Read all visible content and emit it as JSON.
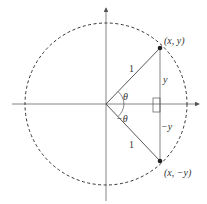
{
  "diagram": {
    "labels": {
      "point_top": "(x, y)",
      "point_bottom": "(x, −y)",
      "radius_top": "1",
      "radius_bottom": "1",
      "angle_pos": "θ",
      "angle_neg": "−θ",
      "side_pos": "y",
      "side_neg": "−y"
    },
    "colors": {
      "axis": "#555555",
      "circle": "#333333",
      "line": "#444444",
      "point": "#222222"
    }
  }
}
